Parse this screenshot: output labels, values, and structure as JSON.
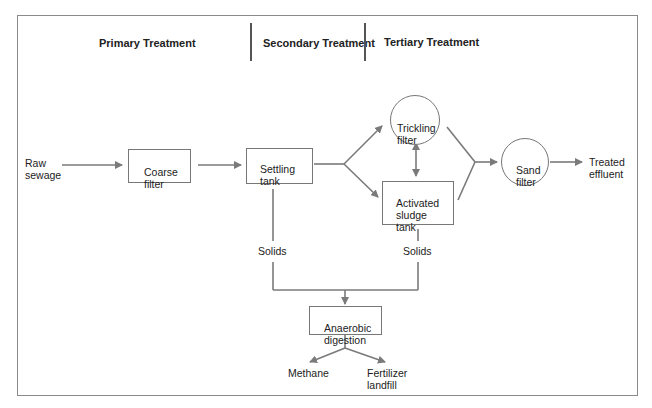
{
  "headers": {
    "primary": "Primary Treatment",
    "secondary": "Secondary Treatment",
    "tertiary": "Tertiary Treatment"
  },
  "nodes": {
    "raw_sewage": "Raw\nsewage",
    "coarse_filter": "Coarse\nfilter",
    "settling_tank": "Settling\ntank",
    "trickling_filter": "Trickling\nfilter",
    "activated_sludge_tank": "Activated\nsludge\ntank",
    "sand_filter": "Sand\nfilter",
    "treated_effluent": "Treated\neffluent",
    "solids_primary": "Solids",
    "solids_secondary": "Solids",
    "anaerobic_digestion": "Anaerobic\ndigestion",
    "methane": "Methane",
    "fertilizer_landfill": "Fertilizer\nlandfill"
  },
  "colors": {
    "arrow": "#7a7a7a",
    "border": "#777777",
    "text": "#222222"
  }
}
